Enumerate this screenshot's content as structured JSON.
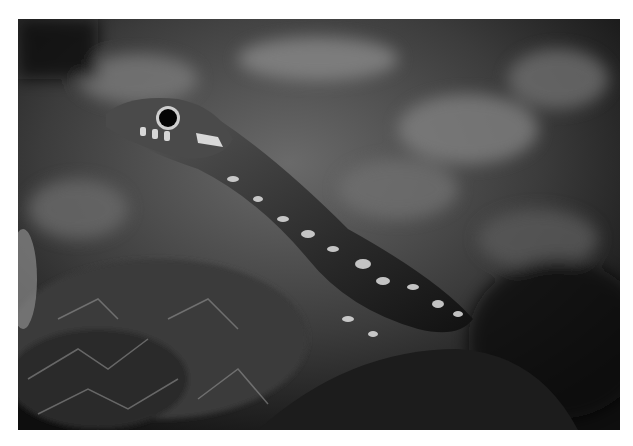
{
  "image": {
    "description": "Black-and-white close-up photograph of a snake raising its head above moss",
    "subject": "snake",
    "setting": "moss and grass, blurred background",
    "tone": "grayscale",
    "border_color": "#ffffff"
  }
}
